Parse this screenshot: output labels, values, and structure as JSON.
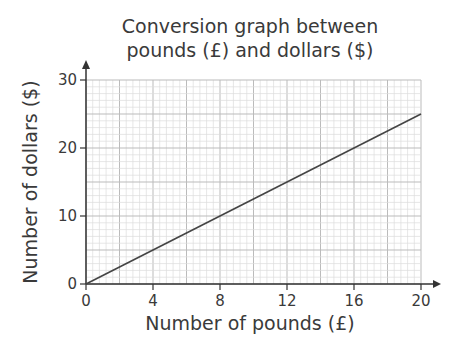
{
  "chart_data": {
    "type": "line",
    "title": "Conversion graph between pounds (£) and dollars ($)",
    "title_lines": [
      "Conversion graph between",
      "pounds (£) and dollars ($)"
    ],
    "xlabel": "Number of pounds (£)",
    "ylabel": "Number of dollars ($)",
    "xlim": [
      0,
      20
    ],
    "ylim": [
      0,
      30
    ],
    "x_ticks": [
      0,
      4,
      8,
      12,
      16,
      20
    ],
    "y_ticks": [
      0,
      10,
      20,
      30
    ],
    "grid": true,
    "series": [
      {
        "name": "Conversion",
        "x": [
          0,
          20
        ],
        "y": [
          0,
          25
        ]
      }
    ]
  },
  "colors": {
    "line": "#444444",
    "grid_minor": "#dddddd",
    "grid_major": "#bbbbbb",
    "axis": "#333333"
  }
}
